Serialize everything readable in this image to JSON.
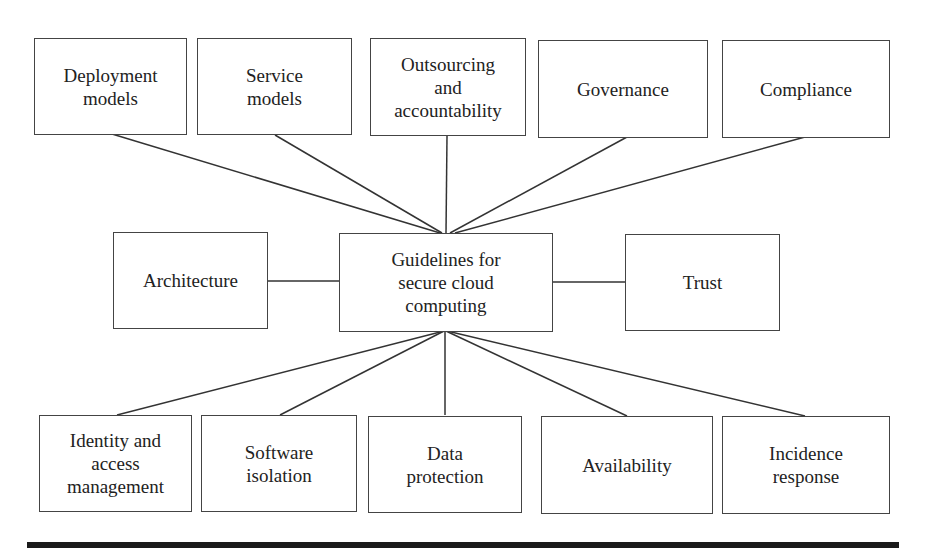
{
  "diagram": {
    "center": {
      "label": "Guidelines for\nsecure cloud\ncomputing"
    },
    "top": [
      {
        "label": "Deployment\nmodels"
      },
      {
        "label": "Service\nmodels"
      },
      {
        "label": "Outsourcing\nand\naccountability"
      },
      {
        "label": "Governance"
      },
      {
        "label": "Compliance"
      }
    ],
    "middle": [
      {
        "label": "Architecture"
      },
      {
        "label": "Trust"
      }
    ],
    "bottom": [
      {
        "label": "Identity and\naccess\nmanagement"
      },
      {
        "label": "Software\nisolation"
      },
      {
        "label": "Data\nprotection"
      },
      {
        "label": "Availability"
      },
      {
        "label": "Incidence\nresponse"
      }
    ]
  }
}
